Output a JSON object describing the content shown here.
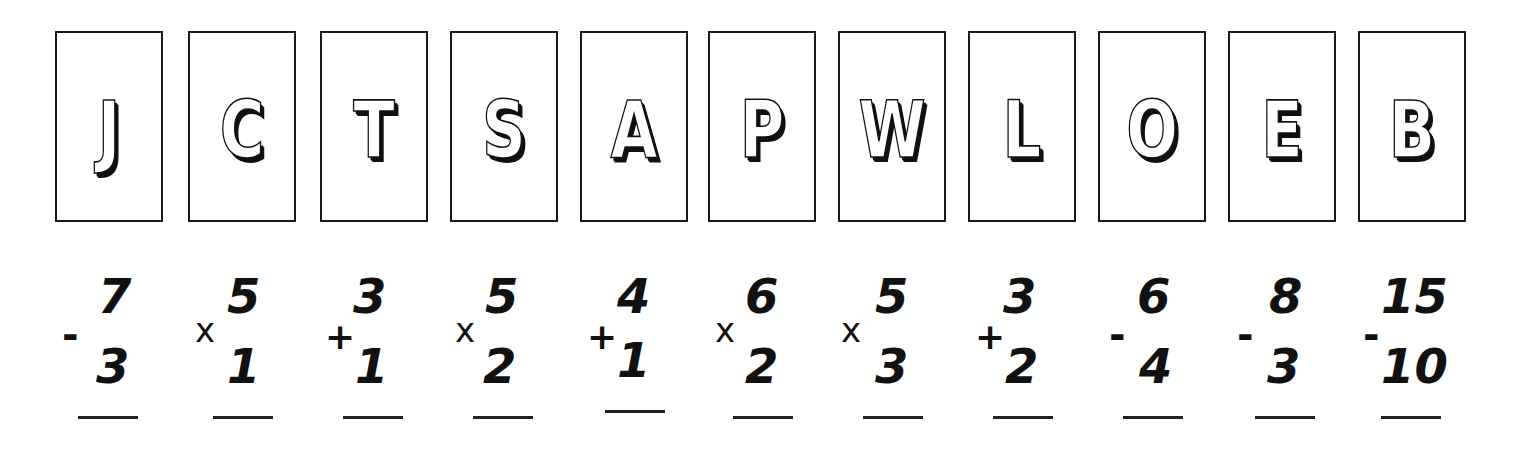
{
  "worksheet": {
    "cards": [
      {
        "letter": "J"
      },
      {
        "letter": "C"
      },
      {
        "letter": "T"
      },
      {
        "letter": "S"
      },
      {
        "letter": "A"
      },
      {
        "letter": "P"
      },
      {
        "letter": "W"
      },
      {
        "letter": "L"
      },
      {
        "letter": "O"
      },
      {
        "letter": "E"
      },
      {
        "letter": "B"
      }
    ],
    "problems": [
      {
        "top": "7",
        "operator": "-",
        "bottom": "3",
        "answer": ""
      },
      {
        "top": "5",
        "operator": "x",
        "bottom": "1",
        "answer": ""
      },
      {
        "top": "3",
        "operator": "+",
        "bottom": "1",
        "answer": ""
      },
      {
        "top": "5",
        "operator": "x",
        "bottom": "2",
        "answer": ""
      },
      {
        "top": "4",
        "operator": "+",
        "bottom": "1",
        "answer": ""
      },
      {
        "top": "6",
        "operator": "x",
        "bottom": "2",
        "answer": ""
      },
      {
        "top": "5",
        "operator": "x",
        "bottom": "3",
        "answer": ""
      },
      {
        "top": "3",
        "operator": "+",
        "bottom": "2",
        "answer": ""
      },
      {
        "top": "6",
        "operator": "-",
        "bottom": "4",
        "answer": ""
      },
      {
        "top": "8",
        "operator": "-",
        "bottom": "3",
        "answer": ""
      },
      {
        "top": "15",
        "operator": "-",
        "bottom": "10",
        "answer": ""
      }
    ]
  }
}
